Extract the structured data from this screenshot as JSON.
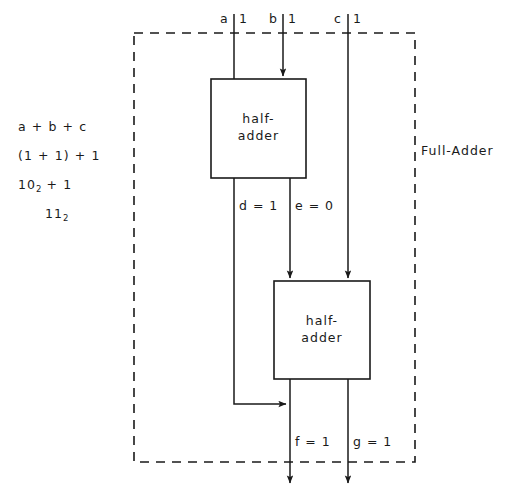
{
  "figure": {
    "boundary_label": "Full-Adder",
    "colors": {
      "ink": "#1a1a1a",
      "background": "#ffffff"
    }
  },
  "calculation": {
    "lines": [
      {
        "text": "a + b + c",
        "sub": "",
        "indented": false
      },
      {
        "text": "(1 + 1) + 1",
        "sub": "",
        "indented": false
      },
      {
        "text": "10",
        "sub": "2",
        "tail": " + 1",
        "indented": false
      },
      {
        "text": "11",
        "sub": "2",
        "tail": "",
        "indented": true
      }
    ]
  },
  "inputs": [
    {
      "name": "a",
      "value": "1",
      "label_name": "a",
      "label_value": "1"
    },
    {
      "name": "b",
      "value": "1",
      "label_name": "b",
      "label_value": "1"
    },
    {
      "name": "c",
      "value": "1",
      "label_name": "c",
      "label_value": "1"
    }
  ],
  "blocks": [
    {
      "id": "half-adder-1",
      "line1": "half-",
      "line2": "adder"
    },
    {
      "id": "half-adder-2",
      "line1": "half-",
      "line2": "adder"
    }
  ],
  "intermediate_signals": [
    {
      "name": "d",
      "label": "d = 1"
    },
    {
      "name": "e",
      "label": "e = 0"
    }
  ],
  "outputs": [
    {
      "name": "f",
      "label": "f = 1"
    },
    {
      "name": "g",
      "label": "g = 1"
    }
  ]
}
